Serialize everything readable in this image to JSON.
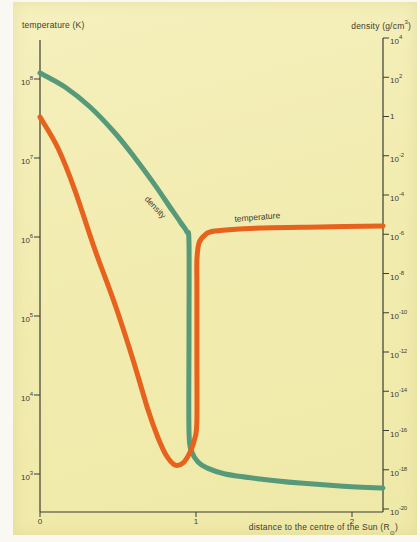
{
  "figure": {
    "paper_color": "#f1ebae",
    "margin_color": "#f9f8f3",
    "axis_color": "#3b3c33",
    "text_color": "#3b3c33"
  },
  "chart_data": {
    "type": "line",
    "title": "",
    "grid": false,
    "legend_position": "inline-curve-labels",
    "x_axis": {
      "title": {
        "text": "distance to the centre of the Sun (R",
        "sub": "⊙",
        "close": ")"
      },
      "ticks": [
        "0",
        "1",
        "2"
      ],
      "range": [
        0,
        2.2
      ]
    },
    "left_axis": {
      "title": "temperature (K)",
      "scale": "log",
      "ticks": [
        {
          "b": "10",
          "e": "8"
        },
        {
          "b": "10",
          "e": "7"
        },
        {
          "b": "10",
          "e": "6"
        },
        {
          "b": "10",
          "e": "5"
        },
        {
          "b": "10",
          "e": "4"
        },
        {
          "b": "10",
          "e": "3"
        }
      ],
      "range": [
        1000,
        100000000
      ]
    },
    "right_axis": {
      "title": {
        "text": "density (g/cm",
        "sup": "3",
        "close": ")"
      },
      "scale": "log",
      "ticks": [
        {
          "b": "10",
          "e": "4"
        },
        {
          "b": "10",
          "e": "2"
        },
        {
          "b": "1",
          "e": ""
        },
        {
          "b": "10",
          "e": "-2"
        },
        {
          "b": "10",
          "e": "-4"
        },
        {
          "b": "10",
          "e": "-6"
        },
        {
          "b": "10",
          "e": "-8"
        },
        {
          "b": "10",
          "e": "-10"
        },
        {
          "b": "10",
          "e": "-12"
        },
        {
          "b": "10",
          "e": "-14"
        },
        {
          "b": "10",
          "e": "-16"
        },
        {
          "b": "10",
          "e": "-18"
        },
        {
          "b": "10",
          "e": "-20"
        }
      ],
      "range": [
        1e-20,
        10000
      ]
    },
    "series": [
      {
        "name": "temperature",
        "curve_label": "temperature",
        "axis": "left",
        "color": "#e6621d",
        "units": "K",
        "points": [
          [
            0,
            33000000.0
          ],
          [
            0.115,
            13400000.0
          ],
          [
            0.224,
            3900000.0
          ],
          [
            0.353,
            680000.0
          ],
          [
            0.481,
            140000.0
          ],
          [
            0.596,
            28000.0
          ],
          [
            0.692,
            6500
          ],
          [
            0.756,
            2900
          ],
          [
            0.808,
            1740
          ],
          [
            0.865,
            1300
          ],
          [
            0.917,
            1380
          ],
          [
            0.962,
            1900
          ],
          [
            0.994,
            2900
          ],
          [
            1.006,
            4800
          ],
          [
            1.006,
            30000
          ],
          [
            1.006,
            240000
          ],
          [
            1.006,
            510000
          ],
          [
            1.019,
            840000
          ],
          [
            1.058,
            1060000.0
          ],
          [
            1.122,
            1190000.0
          ],
          [
            1.41,
            1300000.0
          ],
          [
            1.795,
            1340000.0
          ],
          [
            2.199,
            1380000.0
          ]
        ]
      },
      {
        "name": "density",
        "curve_label": "density",
        "axis": "right",
        "color": "#569a79",
        "units": "g/cm3",
        "points": [
          [
            0,
            165
          ],
          [
            0.16,
            31.8
          ],
          [
            0.321,
            3.05
          ],
          [
            0.481,
            0.144
          ],
          [
            0.609,
            0.0077
          ],
          [
            0.737,
            0.00032
          ],
          [
            0.833,
            2.45e-05
          ],
          [
            0.904,
            3.74e-06
          ],
          [
            0.942,
            1.3e-06
          ],
          [
            0.955,
            3.6e-07
          ],
          [
            0.955,
            1e-11
          ],
          [
            0.955,
            8.4e-17
          ],
          [
            0.974,
            8e-18
          ],
          [
            1.013,
            2.5e-18
          ],
          [
            1.071,
            1.23e-18
          ],
          [
            1.186,
            6.1e-19
          ],
          [
            1.41,
            3.4e-19
          ],
          [
            1.667,
            2.1e-19
          ],
          [
            1.923,
            1.5e-19
          ],
          [
            2.199,
            1.17e-19
          ]
        ]
      }
    ]
  }
}
